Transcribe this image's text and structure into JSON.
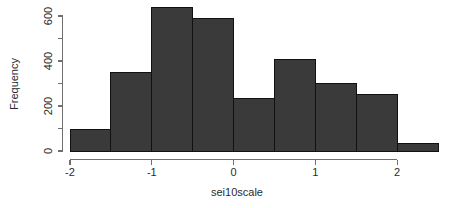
{
  "chart_data": {
    "type": "bar",
    "subtype": "histogram",
    "title": "",
    "xlabel": "sei10scale",
    "ylabel": "Frequency",
    "bin_width": 0.5,
    "bin_edges": [
      -2.0,
      -1.5,
      -1.0,
      -0.5,
      0.0,
      0.5,
      1.0,
      1.5,
      2.0,
      2.5
    ],
    "categories": [
      "-2.0 to -1.5",
      "-1.5 to -1.0",
      "-1.0 to -0.5",
      "-0.5 to 0.0",
      "0.0 to 0.5",
      "0.5 to 1.0",
      "1.0 to 1.5",
      "1.5 to 2.0",
      "2.0 to 2.5"
    ],
    "bin_centers": [
      -1.75,
      -1.25,
      -0.75,
      -0.25,
      0.25,
      0.75,
      1.25,
      1.75,
      2.25
    ],
    "values": [
      95,
      350,
      640,
      590,
      235,
      405,
      300,
      250,
      35
    ],
    "xlim": [
      -2.0,
      2.5
    ],
    "ylim": [
      0,
      660
    ],
    "x_ticks": [
      -2,
      -1,
      0,
      1,
      2
    ],
    "x_tick_labels": [
      "-2",
      "-1",
      "0",
      "1",
      "2"
    ],
    "y_ticks": [
      0,
      100,
      200,
      300,
      400,
      500,
      600
    ],
    "y_tick_labels": [
      "0",
      "",
      "200",
      "",
      "400",
      "",
      "600"
    ],
    "y_labeled_ticks": [
      0,
      200,
      400,
      600
    ],
    "grid": false,
    "legend": false,
    "legend_position": "none",
    "colors": {
      "bar_fill": "#3a3a3a",
      "bar_border": "#111111",
      "axis": "#6f6f6f",
      "text": "#2b2b2b",
      "background": "#ffffff"
    }
  },
  "labels": {
    "x_axis_title": "sei10scale",
    "y_axis_title": "Frequency"
  }
}
